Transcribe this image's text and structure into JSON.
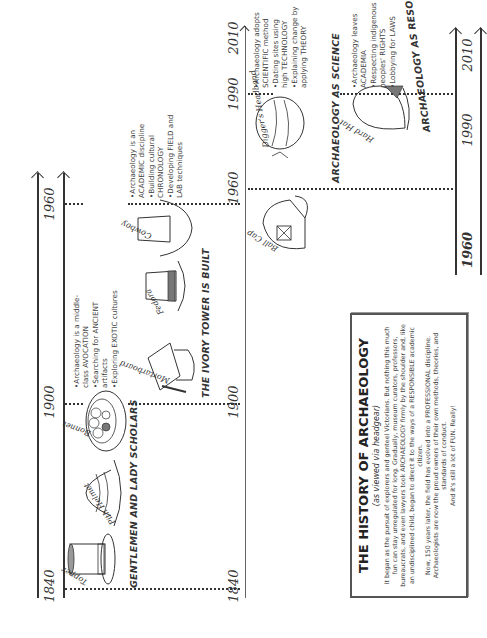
{
  "infographic": {
    "title": "THE HISTORY OF ARCHAEOLOGY",
    "subtitle": "(as viewed via headgear)",
    "paragraphs": [
      "It began as the pursuit of explorers and genteel Victorians. But nothing this much fun can stay unregulated for long. Gradually, museum curators, professors, bureaucrats, and even lawyers took ARCHAEOLOGY firmly by the shoulder and, like an undisciplined child, began to direct it to the ways of a RESPONSIBLE academic citizen.",
      "Now, 150 years later, the field has evolved into a PROFESSIONAL discipline. Archaeologists are now the proud owners of their own methods, theories, and standards of conduct.",
      "And it's still a lot of FUN. Really!"
    ]
  },
  "timelines": [
    {
      "era": "GENTLEMEN AND LADY SCHOLARS",
      "years": [
        "1840",
        "1900",
        "1960"
      ],
      "hats": [
        "Topper",
        "Pith Helmet",
        "Bonnet"
      ],
      "bullets": [
        "•Archaeology is a middle-",
        "class AVOCATION",
        "•Searching for ANCIENT",
        "artifacts",
        "•Exploring EXOTIC cultures"
      ]
    },
    {
      "era": "THE IVORY TOWER IS BUILT",
      "years": [
        "1840",
        "1900",
        "1960",
        "1990",
        "2010"
      ],
      "hats": [
        "Mortarboard",
        "Fedora",
        "Cowboy"
      ],
      "bullets": [
        "•Archaeology is an",
        "ACADEMIC discipline",
        "•Building cultural",
        "CHRONOLOGY",
        "•Developing FIELD and",
        "LAB techniques"
      ]
    },
    {
      "era": "ARCHAEOLOGY AS SCIENCE",
      "years": [],
      "hats": [
        "Ball Cap",
        "Digger's Headband"
      ],
      "bullets": [
        "•Archaeology adopts",
        "SCIENTIFIC method",
        "•Dating sites using",
        "high TECHNOLOGY",
        "•Explaining change by",
        "applying THEORY"
      ]
    },
    {
      "era": "ARCHAEOLOGY AS RESOURCE",
      "years": [
        "1960",
        "1990",
        "2010"
      ],
      "hats": [
        "Hard Hat"
      ],
      "bullets": [
        "•Archaeology leaves",
        "ACADEMIA",
        "•Respecting indigenous",
        "peoples' RIGHTS",
        "•Lobbying for LAWS"
      ]
    }
  ]
}
